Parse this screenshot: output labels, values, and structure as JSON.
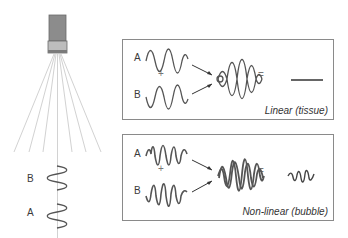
{
  "left_panel": {
    "transducer_label": "transducer",
    "wave_b_label": "B",
    "wave_a_label": "A"
  },
  "linear_panel": {
    "input_a_label": "A",
    "input_b_label": "B",
    "plus": "+",
    "equals": "=",
    "caption": "Linear (tissue)"
  },
  "nonlinear_panel": {
    "input_a_label": "A",
    "input_b_label": "B",
    "plus": "+",
    "equals": "=",
    "caption": "Non-linear (bubble)"
  },
  "colors": {
    "wave": "#555555",
    "beam": "#d0d0d0",
    "transducer_body": "#8c8c8c",
    "transducer_face": "#bdbdbd",
    "box_border": "#8a8a8a"
  }
}
